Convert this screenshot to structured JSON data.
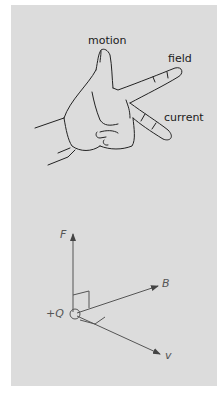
{
  "figure": {
    "hand": {
      "labels": {
        "thumb": "motion",
        "index": "field",
        "middle": "current"
      }
    },
    "vector_diagram": {
      "labels": {
        "force": "F",
        "field": "B",
        "charge": "+Q",
        "velocity": "v"
      }
    }
  },
  "colors": {
    "panel_background": "#dcdcdc",
    "line": "#222222",
    "vector": "#555555"
  }
}
